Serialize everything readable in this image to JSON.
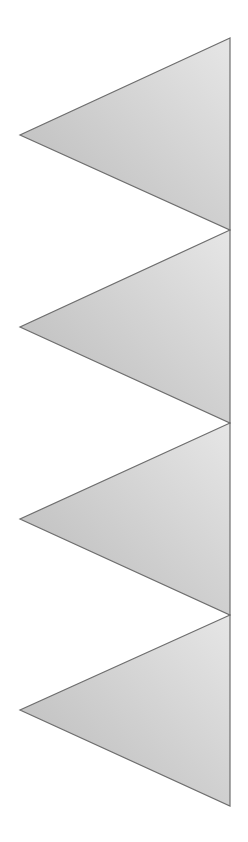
{
  "page": {
    "width": 248,
    "height": 842,
    "background": "#ffffff",
    "top_text_fragment": ""
  },
  "graphic": {
    "description": "Vertical zigzag of four left-pointing gray gradient triangles sharing a right edge",
    "right_edge_x": 230,
    "stroke_color": "#6e6e6e",
    "stroke_width": 1.2,
    "gradient": {
      "dark": "#b9b9b9",
      "light": "#e6e6e6"
    },
    "triangles": [
      {
        "id": 1,
        "top": [
          230,
          38
        ],
        "tip": [
          20,
          135
        ],
        "bottom": [
          230,
          230
        ]
      },
      {
        "id": 2,
        "top": [
          230,
          230
        ],
        "tip": [
          20,
          327
        ],
        "bottom": [
          230,
          423
        ]
      },
      {
        "id": 3,
        "top": [
          230,
          423
        ],
        "tip": [
          20,
          519
        ],
        "bottom": [
          230,
          615
        ]
      },
      {
        "id": 4,
        "top": [
          230,
          615
        ],
        "tip": [
          20,
          710
        ],
        "bottom": [
          230,
          806
        ]
      }
    ]
  }
}
